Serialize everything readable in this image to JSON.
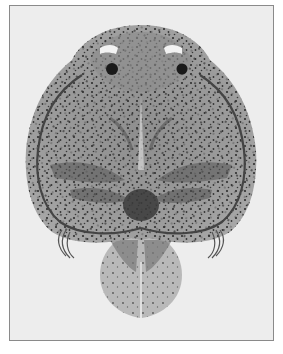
{
  "image": {
    "subject": "fish louse (Argulus) micrograph",
    "style": "grayscale photograph in thin rectangular frame",
    "colors": {
      "background": "#ededed",
      "frame_border": "#8a8a8a",
      "body": "#9a9a9a",
      "body_dark": "#5a5a5a",
      "speckle": "#2e2e2e",
      "eye": "#1a1a1a",
      "highlight": "#f2f2f2"
    }
  }
}
